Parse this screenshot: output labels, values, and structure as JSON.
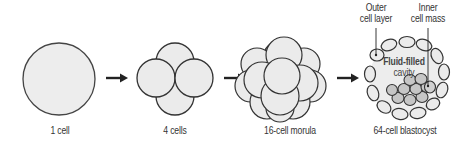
{
  "diagram": {
    "stages": [
      {
        "id": "one-cell",
        "label": "1 cell"
      },
      {
        "id": "four-cells",
        "label": "4 cells"
      },
      {
        "id": "morula",
        "label": "16-cell morula"
      },
      {
        "id": "blastocyst",
        "label": "64-cell blastocyst"
      }
    ],
    "annotations": {
      "outer_cell_layer": [
        "Outer",
        "cell layer"
      ],
      "inner_cell_mass": [
        "Inner",
        "cell mass"
      ],
      "cavity": [
        "Fluid-filled",
        "cavity"
      ]
    },
    "colors": {
      "cell_fill": "#ececec",
      "inner_mass_fill": "#c4c4c4",
      "stroke": "#333333",
      "arrow": "#222222",
      "background": "#ffffff"
    }
  }
}
